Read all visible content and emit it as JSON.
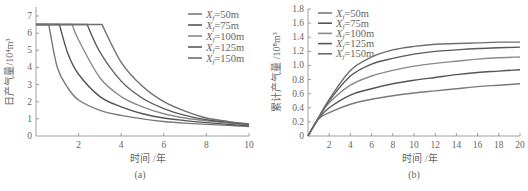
{
  "chart_data": [
    {
      "id": "a",
      "type": "line",
      "caption": "(a)",
      "title": "",
      "xlabel": "时间 /年",
      "ylabel": "日产气量/10⁴m³",
      "xlim": [
        0,
        10
      ],
      "ylim": [
        0,
        7
      ],
      "xticks": [
        "2",
        "4",
        "6",
        "8",
        "10"
      ],
      "yticks": [
        "0",
        "1",
        "2",
        "3",
        "4",
        "5",
        "6",
        "7"
      ],
      "grid": false,
      "legend_position": "upper right",
      "plateau": 6.5,
      "series": [
        {
          "name": "Xf=50m",
          "plateau_end": 0.6,
          "x": [
            0,
            0.6,
            1,
            1.5,
            2,
            3,
            4,
            5,
            6,
            7,
            8,
            9,
            10
          ],
          "values": [
            6.5,
            6.5,
            4.0,
            2.8,
            2.1,
            1.5,
            1.2,
            1.0,
            0.85,
            0.75,
            0.68,
            0.62,
            0.55
          ]
        },
        {
          "name": "Xf=75m",
          "plateau_end": 1.1,
          "x": [
            0,
            1.1,
            1.5,
            2,
            3,
            4,
            5,
            6,
            7,
            8,
            9,
            10
          ],
          "values": [
            6.5,
            6.5,
            4.8,
            3.6,
            2.3,
            1.7,
            1.3,
            1.05,
            0.9,
            0.78,
            0.68,
            0.6
          ]
        },
        {
          "name": "Xf=100m",
          "plateau_end": 1.7,
          "x": [
            0,
            1.7,
            2,
            3,
            4,
            5,
            6,
            7,
            8,
            9,
            10
          ],
          "values": [
            6.5,
            6.5,
            5.6,
            3.4,
            2.3,
            1.7,
            1.3,
            1.05,
            0.88,
            0.75,
            0.65
          ]
        },
        {
          "name": "Xf=125m",
          "plateau_end": 2.4,
          "x": [
            0,
            2.4,
            3,
            4,
            5,
            6,
            7,
            8,
            9,
            10
          ],
          "values": [
            6.5,
            6.5,
            4.9,
            3.2,
            2.2,
            1.6,
            1.2,
            0.95,
            0.8,
            0.68
          ]
        },
        {
          "name": "Xf=150m",
          "plateau_end": 3.1,
          "x": [
            0,
            3.1,
            4,
            5,
            6,
            7,
            8,
            9,
            10
          ],
          "values": [
            6.5,
            6.5,
            4.3,
            2.9,
            2.0,
            1.45,
            1.05,
            0.85,
            0.7
          ]
        }
      ]
    },
    {
      "id": "b",
      "type": "line",
      "caption": "(b)",
      "title": "",
      "xlabel": "时间 /年",
      "ylabel": "累计产气量 /10⁸m³",
      "xlim": [
        0,
        20
      ],
      "ylim": [
        0,
        1.8
      ],
      "xticks": [
        "2",
        "4",
        "6",
        "8",
        "10",
        "12",
        "14",
        "16",
        "18",
        "20"
      ],
      "yticks": [
        "0",
        "0.2",
        "0.4",
        "0.6",
        "0.8",
        "1.0",
        "1.2",
        "1.4",
        "1.6",
        "1.8"
      ],
      "grid": false,
      "legend_position": "upper left",
      "series": [
        {
          "name": "Xf=50m",
          "x": [
            0,
            1,
            2,
            4,
            6,
            8,
            10,
            12,
            14,
            16,
            18,
            20
          ],
          "values": [
            0,
            0.24,
            0.33,
            0.45,
            0.52,
            0.57,
            0.61,
            0.64,
            0.67,
            0.7,
            0.72,
            0.74
          ]
        },
        {
          "name": "Xf=75m",
          "x": [
            0,
            1,
            2,
            4,
            6,
            8,
            10,
            12,
            14,
            16,
            18,
            20
          ],
          "values": [
            0,
            0.25,
            0.4,
            0.58,
            0.67,
            0.74,
            0.79,
            0.83,
            0.87,
            0.9,
            0.92,
            0.94
          ]
        },
        {
          "name": "Xf=100m",
          "x": [
            0,
            1,
            2,
            4,
            6,
            8,
            10,
            12,
            14,
            16,
            18,
            20
          ],
          "values": [
            0,
            0.26,
            0.47,
            0.72,
            0.85,
            0.93,
            0.99,
            1.03,
            1.06,
            1.09,
            1.11,
            1.12
          ]
        },
        {
          "name": "Xf=125m",
          "x": [
            0,
            1,
            2,
            4,
            6,
            8,
            10,
            12,
            14,
            16,
            18,
            20
          ],
          "values": [
            0,
            0.26,
            0.5,
            0.85,
            1.02,
            1.1,
            1.16,
            1.2,
            1.22,
            1.24,
            1.25,
            1.26
          ]
        },
        {
          "name": "Xf=150m",
          "x": [
            0,
            1,
            2,
            4,
            6,
            8,
            10,
            12,
            14,
            16,
            18,
            20
          ],
          "values": [
            0,
            0.26,
            0.52,
            0.93,
            1.12,
            1.22,
            1.27,
            1.3,
            1.31,
            1.32,
            1.33,
            1.33
          ]
        }
      ]
    }
  ],
  "legend": {
    "prefix": "X",
    "subscript": "f",
    "labels": [
      "=50m",
      "=75m",
      "=100m",
      "=125m",
      "=150m"
    ]
  },
  "colors": {
    "series": [
      "#7a7a7a",
      "#555555",
      "#8a8a8a",
      "#5a5a5a",
      "#6e6e6e"
    ],
    "axis": "#888888",
    "text": "#666666"
  }
}
